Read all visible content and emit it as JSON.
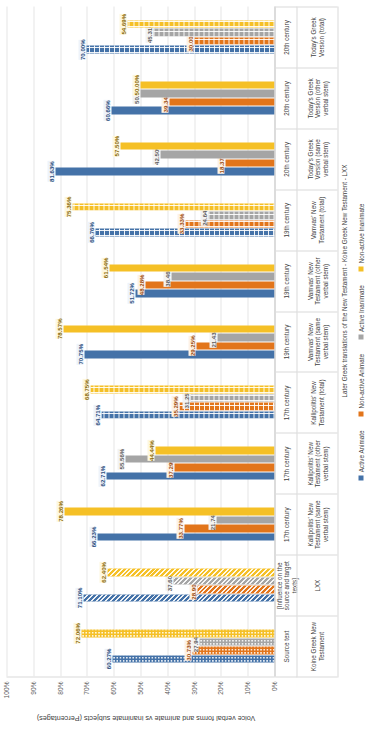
{
  "chart_data": {
    "type": "bar",
    "title": "",
    "xlabel": "",
    "ylabel": "Voice verbal forms and animate vs inanimate subjects (Percentages)",
    "ylim": [
      0,
      100
    ],
    "ytick_labels": [
      "0%",
      "10%",
      "20%",
      "30%",
      "40%",
      "50%",
      "60%",
      "70%",
      "80%",
      "90%",
      "100%"
    ],
    "grid": true,
    "legend_position": "bottom",
    "legend": [
      "Active Animate",
      "Non-active Animate",
      "Active Inanimate",
      "Non-active Inanimate"
    ],
    "series_colors": [
      "#4472a8",
      "#e2751b",
      "#a5a5a5",
      "#f5c026"
    ],
    "categories": [
      "Koine Greek New Testament",
      "LXX",
      "Kallipolitis' New Testament (same verbal stem)",
      "Kallipolitis' New Testament (other verbal stem)",
      "Kallipolitis' New Testament (total)",
      "Vamvas' New Testament (same verbal stem)",
      "Vamvas' New Testament (other verbal stem)",
      "Vamvas' New Testament (total)",
      "Today's Greek Version (same verbal stem)",
      "Today's Greek Version (other verbal stem)",
      "Today's Greek Version (total)"
    ],
    "period_labels": [
      "Source text",
      "[Influence on the source and target texts]",
      "17th century",
      "17th century",
      "17th century",
      "19th century",
      "19th century",
      "19th century",
      "20th century",
      "20th century",
      "20th century"
    ],
    "group_spans": [
      {
        "label": "",
        "span": 2
      },
      {
        "label": "Later Greek translations of the New Testament - Koine Greek New Testament - LXX",
        "span": 9
      }
    ],
    "series": [
      {
        "name": "Active Animate",
        "values": [
          60.27,
          71.1,
          66.23,
          62.71,
          64.71,
          70.75,
          51.72,
          66.76,
          81.63,
          60.66,
          70.0
        ]
      },
      {
        "name": "Non-active Animate",
        "values": [
          30.73,
          28.9,
          33.77,
          37.29,
          35.29,
          29.25,
          48.28,
          33.33,
          18.37,
          39.34,
          30.0
        ]
      },
      {
        "name": "Active Inanimate",
        "values": [
          27.94,
          37.6,
          21.74,
          55.56,
          31.25,
          21.43,
          38.46,
          24.64,
          42.5,
          50.0,
          45.31
        ]
      },
      {
        "name": "Non-active Inanimate",
        "values": [
          72.06,
          62.4,
          78.26,
          44.44,
          68.75,
          78.57,
          61.54,
          75.36,
          57.5,
          50.0,
          54.69
        ]
      }
    ],
    "value_labels": [
      [
        "60.27%",
        "71.10%",
        "66.23%",
        "62.71%",
        "64.71%",
        "70.75%",
        "51.72%",
        "66.76%",
        "81.63%",
        "60.66%",
        "70.00%"
      ],
      [
        "30.73%",
        "28.90%",
        "33.77%",
        "37.29%",
        "35.29%",
        "29.25%",
        "48.28%",
        "33.33%",
        "18.37%",
        "39.34%",
        "30.00%"
      ],
      [
        "27.94%",
        "37.60%",
        "21.74%",
        "55.56%",
        "31.25%",
        "21.43%",
        "38.46%",
        "24.64%",
        "42.50%",
        "50.00%",
        "45.31%"
      ],
      [
        "72.06%",
        "62.40%",
        "78.26%",
        "44.44%",
        "68.75%",
        "78.57%",
        "61.54%",
        "75.36%",
        "57.50%",
        "50.00%",
        "54.69%"
      ]
    ],
    "bar_patterns": [
      "dots",
      "diagonal",
      "solid",
      "solid",
      "plus",
      "solid",
      "solid",
      "plus",
      "solid",
      "solid",
      "plus"
    ]
  }
}
